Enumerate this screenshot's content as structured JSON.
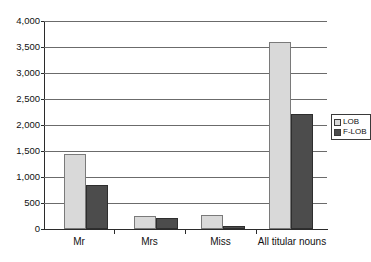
{
  "chart_data": {
    "type": "bar",
    "title": "",
    "subtitle": "",
    "xlabel": "",
    "ylabel": "",
    "categories": [
      "Mr",
      "Mrs",
      "Miss",
      "All titular nouns"
    ],
    "series": [
      {
        "name": "LOB",
        "values": [
          1440,
          250,
          265,
          3590
        ]
      },
      {
        "name": "F-LOB",
        "values": [
          840,
          205,
          60,
          2205
        ]
      }
    ],
    "ylim": [
      0,
      4000
    ],
    "ytick_values": [
      0,
      500,
      1000,
      1500,
      2000,
      2500,
      3000,
      3500,
      4000
    ],
    "ytick_labels": [
      "0",
      "500",
      "1,000",
      "1,500",
      "2,000",
      "2,500",
      "3,000",
      "3,500",
      "4,000"
    ],
    "grid": true,
    "legend_position": "right",
    "legend": [
      {
        "label": "LOB",
        "color": "#d9d9d9"
      },
      {
        "label": "F-LOB",
        "color": "#4c4c4c"
      }
    ],
    "colors": {
      "lob": "#d9d9d9",
      "flob": "#4c4c4c",
      "gridline": "#6b6b6b",
      "axis": "#2b2b2b",
      "background": "#ffffff"
    }
  }
}
